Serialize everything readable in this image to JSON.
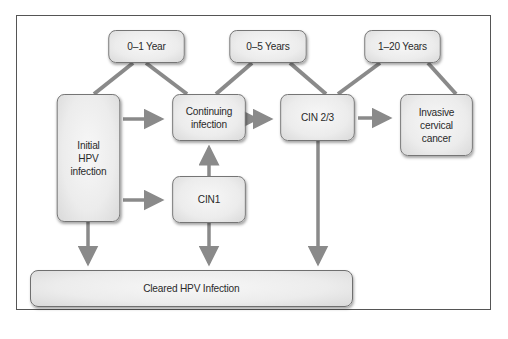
{
  "diagram": {
    "type": "flowchart",
    "topic": "Natural history of HPV infection",
    "time_labels": [
      {
        "id": "t1",
        "label": "0–1 Year"
      },
      {
        "id": "t2",
        "label": "0–5 Years"
      },
      {
        "id": "t3",
        "label": "1–20 Years"
      }
    ],
    "nodes": [
      {
        "id": "initial",
        "label": "Initial\nHPV\ninfection"
      },
      {
        "id": "continuing",
        "label": "Continuing\ninfection"
      },
      {
        "id": "cin23",
        "label": "CIN 2/3"
      },
      {
        "id": "invasive",
        "label": "Invasive\ncervical\ncancer"
      },
      {
        "id": "cin1",
        "label": "CIN1"
      },
      {
        "id": "cleared",
        "label": "Cleared HPV Infection"
      }
    ],
    "edges": [
      {
        "from": "initial",
        "to": "continuing",
        "type": "arrow"
      },
      {
        "from": "initial",
        "to": "cin1",
        "type": "arrow"
      },
      {
        "from": "initial",
        "to": "cleared",
        "type": "arrow"
      },
      {
        "from": "cin1",
        "to": "continuing",
        "type": "arrow"
      },
      {
        "from": "cin1",
        "to": "cleared",
        "type": "arrow"
      },
      {
        "from": "continuing",
        "to": "cin23",
        "type": "bidirectional"
      },
      {
        "from": "cin23",
        "to": "invasive",
        "type": "arrow"
      },
      {
        "from": "cin23",
        "to": "cleared",
        "type": "arrow"
      }
    ],
    "time_links": [
      {
        "label": "t1",
        "spans": [
          "initial",
          "continuing"
        ]
      },
      {
        "label": "t2",
        "spans": [
          "continuing",
          "cin23"
        ]
      },
      {
        "label": "t3",
        "spans": [
          "cin23",
          "invasive"
        ]
      }
    ],
    "colors": {
      "connector": "#8a8a8a",
      "node_border": "#6f6f6f",
      "node_fill": "#ececec",
      "frame": "#555555"
    }
  }
}
